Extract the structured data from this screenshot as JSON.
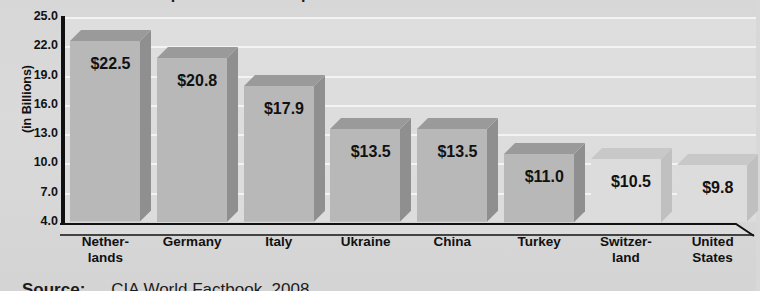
{
  "figure": {
    "title_partial": "Top Natural Gas Importers",
    "source_label": "Source:",
    "source_text": "CIA World Factbook, 2008"
  },
  "axis": {
    "y_label": "(in Billions)",
    "ticks": [
      "25.0",
      "22.0",
      "19.0",
      "16.0",
      "13.0",
      "10.0",
      "7.0",
      "4.0"
    ]
  },
  "colors": {
    "bar_front_dark": "#b8b8b8",
    "bar_top_dark": "#9a9a9a",
    "bar_side_dark": "#8f8f8f",
    "bar_front_light": "#dcdcdc",
    "bar_top_light": "#c8c8c8",
    "bar_side_light": "#c0c0c0",
    "plot_background": "#dedede",
    "gridline": "#f3f3f3",
    "axis": "#101010",
    "text": "#111111"
  },
  "chart_data": {
    "type": "bar",
    "title": "Top Natural Gas Importers",
    "xlabel": "",
    "ylabel": "(in Billions)",
    "ylim": [
      4.0,
      25.0
    ],
    "ytick_values": [
      25.0,
      22.0,
      19.0,
      16.0,
      13.0,
      10.0,
      7.0,
      4.0
    ],
    "grid": true,
    "legend": "none",
    "categories": [
      "Nether-\nlands",
      "Germany",
      "Italy",
      "Ukraine",
      "China",
      "Turkey",
      "Switzer-\nland",
      "United\nStates"
    ],
    "values": [
      22.5,
      20.8,
      17.9,
      13.5,
      13.5,
      11.0,
      10.5,
      9.8
    ],
    "data_labels": [
      "$22.5",
      "$20.8",
      "$17.9",
      "$13.5",
      "$13.5",
      "$11.0",
      "$10.5",
      "$9.8"
    ],
    "bars": [
      {
        "category_line1": "Nether-",
        "category_line2": "lands",
        "value": 22.5,
        "label": "$22.5",
        "shade": "dark"
      },
      {
        "category_line1": "Germany",
        "category_line2": "",
        "value": 20.8,
        "label": "$20.8",
        "shade": "dark"
      },
      {
        "category_line1": "Italy",
        "category_line2": "",
        "value": 17.9,
        "label": "$17.9",
        "shade": "dark"
      },
      {
        "category_line1": "Ukraine",
        "category_line2": "",
        "value": 13.5,
        "label": "$13.5",
        "shade": "dark"
      },
      {
        "category_line1": "China",
        "category_line2": "",
        "value": 13.5,
        "label": "$13.5",
        "shade": "dark"
      },
      {
        "category_line1": "Turkey",
        "category_line2": "",
        "value": 11.0,
        "label": "$11.0",
        "shade": "dark"
      },
      {
        "category_line1": "Switzer-",
        "category_line2": "land",
        "value": 10.5,
        "label": "$10.5",
        "shade": "light"
      },
      {
        "category_line1": "United",
        "category_line2": "States",
        "value": 9.8,
        "label": "$9.8",
        "shade": "light"
      }
    ]
  }
}
